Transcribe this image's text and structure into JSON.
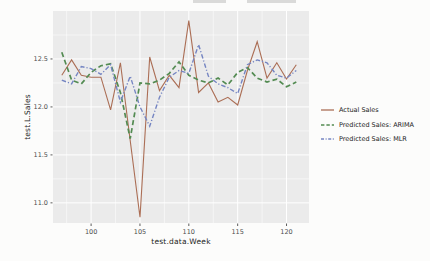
{
  "chart_data": {
    "type": "line",
    "title": "",
    "xlabel": "test.data.Week",
    "ylabel": "test.L.Sales",
    "x": [
      97,
      98,
      99,
      100,
      101,
      102,
      103,
      104,
      105,
      106,
      107,
      108,
      109,
      110,
      111,
      112,
      113,
      114,
      115,
      116,
      117,
      118,
      119,
      120,
      121
    ],
    "series": [
      {
        "name": "Actual Sales",
        "color": "#ab6e55",
        "linestyle": "solid",
        "values": [
          12.33,
          12.49,
          12.33,
          12.31,
          12.31,
          11.97,
          12.46,
          11.65,
          10.85,
          12.52,
          12.17,
          12.33,
          12.2,
          12.9,
          12.15,
          12.25,
          12.05,
          12.1,
          12.02,
          12.38,
          12.68,
          12.3,
          12.46,
          12.29,
          12.44
        ]
      },
      {
        "name": "Predicted Sales: ARIMA",
        "color": "#538b52",
        "linestyle": "dashed",
        "values": [
          12.57,
          12.28,
          12.24,
          12.36,
          12.43,
          12.45,
          12.15,
          11.67,
          12.25,
          12.24,
          12.28,
          12.35,
          12.47,
          12.33,
          12.28,
          12.25,
          12.3,
          12.23,
          12.36,
          12.41,
          12.3,
          12.26,
          12.29,
          12.21,
          12.26
        ]
      },
      {
        "name": "Predicted Sales: MLR",
        "color": "#7585c2",
        "linestyle": "dashdot",
        "values": [
          12.28,
          12.24,
          12.42,
          12.4,
          12.34,
          12.44,
          12.05,
          12.32,
          12.0,
          11.8,
          12.1,
          12.31,
          12.38,
          12.35,
          12.65,
          12.32,
          12.24,
          12.2,
          12.14,
          12.44,
          12.49,
          12.46,
          12.33,
          12.3,
          12.38
        ]
      }
    ],
    "xlim": [
      96.1,
      122.3
    ],
    "ylim": [
      10.79,
      13.0
    ],
    "x_ticks": [
      100,
      105,
      110,
      115,
      120
    ],
    "x_tick_labels": [
      "100",
      "105",
      "110",
      "115",
      "120"
    ],
    "y_ticks": [
      11.0,
      11.5,
      12.0,
      12.5
    ],
    "y_tick_labels": [
      "11.0",
      "11.5",
      "12.0",
      "12.5"
    ],
    "grid": "major-and-minor-white",
    "legend_position": "right",
    "panel_bg": "#ebebeb",
    "grid_color": "#ffffff",
    "tick_label_color": "#4d4d4d",
    "axis_title_color": "#222222"
  }
}
